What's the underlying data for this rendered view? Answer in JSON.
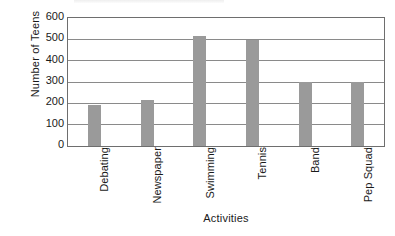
{
  "chart_data": {
    "type": "bar",
    "title": "",
    "xlabel": "Activities",
    "ylabel": "Number of Teens",
    "categories": [
      "Debating",
      "Newspaper",
      "Swimming",
      "Tennis",
      "Band",
      "Pep Squad"
    ],
    "values": [
      190,
      215,
      518,
      495,
      300,
      300
    ],
    "ylim": [
      0,
      600
    ],
    "yticks": [
      0,
      100,
      200,
      300,
      400,
      500,
      600
    ],
    "ytick_labels": [
      "0",
      "100",
      "200",
      "300",
      "400",
      "500",
      "600"
    ],
    "grid": true,
    "legend": false,
    "series": [
      {
        "name": "Number of Teens",
        "values": [
          190,
          215,
          518,
          495,
          300,
          300
        ],
        "color": "#9a9a9a"
      }
    ],
    "bar_color": "#9a9a9a",
    "frame_color": "#6e6e6e",
    "gridline_color": "#8a8a8a",
    "background": "#ffffff"
  }
}
